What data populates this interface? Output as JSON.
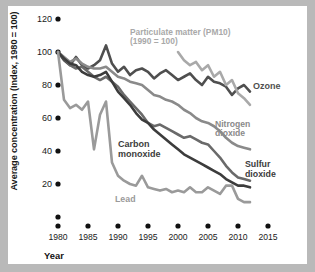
{
  "chart_data": {
    "type": "line",
    "title": "",
    "xlabel": "Year",
    "ylabel": "Average concentration (Index, 1980 = 100)",
    "xlim": [
      1980,
      2015
    ],
    "ylim": [
      0,
      125
    ],
    "xticks": [
      "1980",
      "1985",
      "1990",
      "1995",
      "2000",
      "2005",
      "2010",
      "2015"
    ],
    "yticks": [
      "",
      "20",
      "40",
      "60",
      "80",
      "100",
      "120"
    ],
    "ytick_values": [
      0,
      20,
      40,
      60,
      80,
      100,
      120
    ],
    "grid": false,
    "legend_position": "inline-annotations",
    "annotations": [
      {
        "name": "particulate-matter",
        "text": "Particulate matter (PM10)\n(1990 = 100)",
        "color": "#a9a9a9"
      },
      {
        "name": "ozone",
        "text": "Ozone",
        "color": "#4f4f4f"
      },
      {
        "name": "nitrogen-dioxide",
        "text": "Nitrogen\ndioxide",
        "color": "#8a8a8a"
      },
      {
        "name": "sulfur-dioxide",
        "text": "Sulfur\ndioxide",
        "color": "#3c3c3c"
      },
      {
        "name": "carbon-monoxide",
        "text": "Carbon\nmonoxide",
        "color": "#3c3c3c"
      },
      {
        "name": "lead",
        "text": "Lead",
        "color": "#9a9a9a"
      }
    ],
    "series": [
      {
        "name": "Ozone",
        "color": "#4f4f4f",
        "x": [
          1980,
          1981,
          1982,
          1983,
          1984,
          1985,
          1986,
          1987,
          1988,
          1989,
          1990,
          1991,
          1992,
          1993,
          1994,
          1995,
          1996,
          1997,
          1998,
          1999,
          2000,
          2001,
          2002,
          2003,
          2004,
          2005,
          2006,
          2007,
          2008,
          2009,
          2010,
          2011,
          2012
        ],
        "values": [
          100,
          95,
          92,
          97,
          92,
          90,
          92,
          95,
          104,
          93,
          88,
          91,
          86,
          89,
          90,
          88,
          84,
          87,
          89,
          86,
          83,
          85,
          87,
          83,
          80,
          85,
          82,
          81,
          79,
          74,
          78,
          80,
          76
        ]
      },
      {
        "name": "Nitrogen dioxide",
        "color": "#8a8a8a",
        "x": [
          1980,
          1981,
          1982,
          1983,
          1984,
          1985,
          1986,
          1987,
          1988,
          1989,
          1990,
          1991,
          1992,
          1993,
          1994,
          1995,
          1996,
          1997,
          1998,
          1999,
          2000,
          2001,
          2002,
          2003,
          2004,
          2005,
          2006,
          2007,
          2008,
          2009,
          2010,
          2011,
          2012
        ],
        "values": [
          100,
          97,
          94,
          96,
          93,
          91,
          90,
          90,
          91,
          88,
          85,
          84,
          82,
          81,
          80,
          77,
          74,
          73,
          71,
          70,
          68,
          65,
          63,
          60,
          58,
          57,
          55,
          52,
          48,
          45,
          43,
          42,
          41
        ]
      },
      {
        "name": "Sulfur dioxide",
        "color": "#6a6a6a",
        "x": [
          1980,
          1981,
          1982,
          1983,
          1984,
          1985,
          1986,
          1987,
          1988,
          1989,
          1990,
          1991,
          1992,
          1993,
          1994,
          1995,
          1996,
          1997,
          1998,
          1999,
          2000,
          2001,
          2002,
          2003,
          2004,
          2005,
          2006,
          2007,
          2008,
          2009,
          2010,
          2011,
          2012
        ],
        "values": [
          100,
          96,
          92,
          90,
          91,
          88,
          85,
          83,
          85,
          82,
          79,
          74,
          70,
          66,
          62,
          57,
          55,
          56,
          54,
          52,
          50,
          48,
          49,
          47,
          45,
          44,
          40,
          36,
          31,
          27,
          24,
          23,
          22
        ]
      },
      {
        "name": "Carbon monoxide",
        "color": "#3c3c3c",
        "x": [
          1980,
          1981,
          1982,
          1983,
          1984,
          1985,
          1986,
          1987,
          1988,
          1989,
          1990,
          1991,
          1992,
          1993,
          1994,
          1995,
          1996,
          1997,
          1998,
          1999,
          2000,
          2001,
          2002,
          2003,
          2004,
          2005,
          2006,
          2007,
          2008,
          2009,
          2010,
          2011,
          2012
        ],
        "values": [
          100,
          96,
          93,
          92,
          88,
          86,
          85,
          86,
          88,
          82,
          76,
          72,
          68,
          63,
          59,
          57,
          53,
          50,
          47,
          44,
          41,
          38,
          36,
          34,
          32,
          30,
          28,
          26,
          23,
          21,
          19,
          19,
          18
        ]
      },
      {
        "name": "Lead",
        "color": "#9a9a9a",
        "x": [
          1980,
          1981,
          1982,
          1983,
          1984,
          1985,
          1986,
          1987,
          1988,
          1989,
          1990,
          1991,
          1992,
          1993,
          1994,
          1995,
          1996,
          1997,
          1998,
          1999,
          2000,
          2001,
          2002,
          2003,
          2004,
          2005,
          2006,
          2007,
          2008,
          2009,
          2010,
          2011,
          2012
        ],
        "values": [
          100,
          71,
          66,
          68,
          65,
          70,
          41,
          62,
          70,
          33,
          25,
          22,
          20,
          19,
          25,
          18,
          17,
          16,
          17,
          15,
          16,
          15,
          18,
          15,
          15,
          18,
          16,
          14,
          19,
          19,
          11,
          9,
          9
        ]
      },
      {
        "name": "Particulate matter (PM10)",
        "color": "#a9a9a9",
        "x": [
          2000,
          2001,
          2002,
          2003,
          2004,
          2005,
          2006,
          2007,
          2008,
          2009,
          2010,
          2011,
          2012
        ],
        "values": [
          100,
          95,
          92,
          94,
          89,
          92,
          85,
          88,
          80,
          83,
          75,
          72,
          68
        ]
      }
    ]
  },
  "axis": {
    "y_title": "Average concentration (Index, 1980 = 100)",
    "x_title": "Year"
  }
}
